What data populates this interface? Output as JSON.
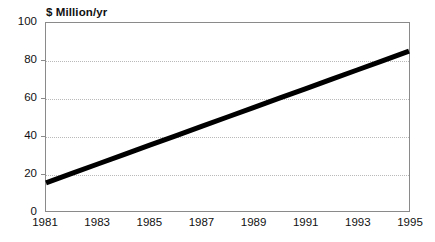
{
  "chart_data": {
    "type": "line",
    "title": "",
    "ylabel": "$ Million/yr",
    "xlabel": "",
    "xlim": [
      1981,
      1995
    ],
    "ylim": [
      0,
      100
    ],
    "grid": true,
    "grid_axis": "y",
    "legend": "none",
    "x": [
      1981,
      1982,
      1983,
      1984,
      1985,
      1986,
      1987,
      1988,
      1989,
      1990,
      1991,
      1992,
      1993,
      1994,
      1995
    ],
    "series": [
      {
        "name": "Revenue",
        "color": "#000000",
        "line_width_px": 5,
        "values": [
          15,
          20,
          25,
          30,
          35,
          40,
          45,
          50,
          55,
          60,
          65,
          70,
          75,
          80,
          85
        ]
      }
    ],
    "y_ticks": [
      0,
      20,
      40,
      60,
      80,
      100
    ],
    "y_tick_labels": [
      "0",
      "20",
      "40",
      "60",
      "80",
      "100"
    ],
    "x_ticks": [
      1981,
      1983,
      1985,
      1987,
      1989,
      1991,
      1993,
      1995
    ],
    "x_tick_labels": [
      "1981",
      "1983",
      "1985",
      "1987",
      "1989",
      "1991",
      "1993",
      "1995"
    ],
    "colors": {
      "background": "#ffffff",
      "axis": "#8a8a8a",
      "gridline": "#b9b9b9",
      "text": "#111111",
      "series": "#000000"
    }
  }
}
